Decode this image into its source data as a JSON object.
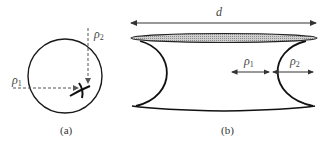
{
  "figure": {
    "panels": [
      {
        "id": "a",
        "caption": "(a)",
        "description": "Circle with two dashed radius arrows meeting at a saddle point",
        "labels": {
          "rho1": "ρ",
          "rho1_sub": "1",
          "rho2": "ρ",
          "rho2_sub": "2"
        }
      },
      {
        "id": "b",
        "caption": "(b)",
        "description": "Concave cylindrical liquid bridge between two plates with width d and principal radii",
        "labels": {
          "d": "d",
          "rho1": "ρ",
          "rho1_sub": "1",
          "rho2": "ρ",
          "rho2_sub": "2"
        }
      }
    ],
    "colors": {
      "stroke": "#1a1a1a",
      "dashed": "#555555",
      "hatch_fill": "#b8b8b8"
    }
  }
}
